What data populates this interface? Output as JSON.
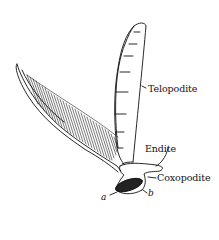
{
  "figure": {
    "labels": {
      "telopodite": "Telopodite",
      "endite": "Endite",
      "coxopodite": "Coxopodite",
      "a": "a",
      "b": "b"
    }
  }
}
